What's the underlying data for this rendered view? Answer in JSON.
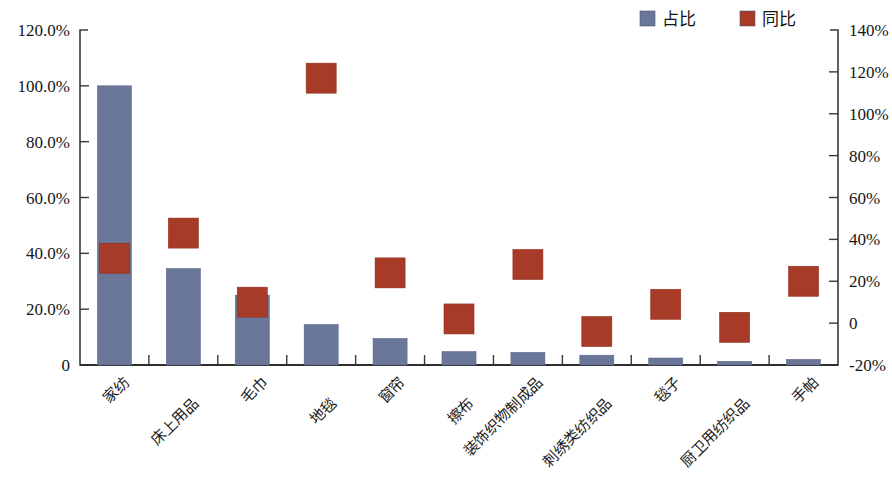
{
  "chart_data": {
    "type": "bar",
    "title": "",
    "subtitle": "",
    "xlabel": "",
    "ylabel": "",
    "grid": false,
    "legend_position": "top-right",
    "categories": [
      "家纺",
      "床上用品",
      "毛巾",
      "地毯",
      "窗帘",
      "擦布",
      "装饰织物制成品",
      "刺绣类纺织品",
      "毯子",
      "厨卫用纺织品",
      "手帕"
    ],
    "series": [
      {
        "name": "占比",
        "type": "bar",
        "axis": "left",
        "color": "#6b7798",
        "values": [
          100.0,
          34.5,
          25.0,
          14.5,
          9.5,
          4.8,
          4.5,
          3.5,
          2.5,
          1.3,
          2.0
        ]
      },
      {
        "name": "同比",
        "type": "scatter",
        "axis": "right",
        "color": "#a83a28",
        "values": [
          31,
          43,
          10,
          117,
          24,
          2,
          28,
          -4,
          9,
          -2,
          20
        ]
      }
    ],
    "left_axis": {
      "ticks": [
        "0",
        "20.0%",
        "40.0%",
        "60.0%",
        "80.0%",
        "100.0%",
        "120.0%"
      ],
      "tick_values": [
        0,
        20,
        40,
        60,
        80,
        100,
        120
      ],
      "ylim": [
        0,
        120
      ]
    },
    "right_axis": {
      "ticks": [
        "-20%",
        "0",
        "20%",
        "40%",
        "60%",
        "80%",
        "100%",
        "120%",
        "140%"
      ],
      "tick_values": [
        -20,
        0,
        20,
        40,
        60,
        80,
        100,
        120,
        140
      ],
      "ylim": [
        -20,
        140
      ]
    },
    "legend": [
      {
        "label": "占比",
        "color": "#6b7798"
      },
      {
        "label": "同比",
        "color": "#a83a28"
      }
    ]
  }
}
